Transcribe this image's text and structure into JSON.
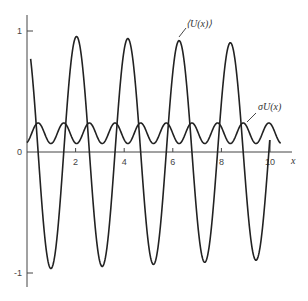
{
  "chart_data": {
    "type": "line",
    "title": "",
    "xlabel": "x",
    "ylabel": "",
    "xlim": [
      0,
      10.9
    ],
    "ylim": [
      -1.1,
      1.15
    ],
    "grid": false,
    "legend": "none",
    "x_ticks": [
      {
        "value": 2,
        "label": "2"
      },
      {
        "value": 4,
        "label": "4"
      },
      {
        "value": 6,
        "label": "6"
      },
      {
        "value": 8,
        "label": "8"
      },
      {
        "value": 10,
        "label": "10"
      }
    ],
    "y_ticks": [
      {
        "value": 1,
        "label": "1"
      },
      {
        "value": 0,
        "label": "0"
      },
      {
        "value": -1,
        "label": "-1"
      }
    ],
    "series": [
      {
        "name": "⟨U(x)⟩",
        "x_range": [
          0.15,
          10.0
        ],
        "model": "amplitude(x)*cos(2*pi*(x-phase)/period)",
        "period": 2.11,
        "phase": 2.04,
        "amplitude_start": 0.97,
        "amplitude_end": 0.89,
        "peaks": [
          [
            2.05,
            0.96
          ],
          [
            4.15,
            0.95
          ],
          [
            6.3,
            0.93
          ],
          [
            8.4,
            0.91
          ]
        ],
        "troughs": [
          [
            1.1,
            -0.97
          ],
          [
            3.15,
            -0.95
          ],
          [
            5.3,
            -0.93
          ],
          [
            7.35,
            -0.91
          ],
          [
            9.45,
            -0.88
          ]
        ]
      },
      {
        "name": "σU(x)",
        "x_range": [
          0.0,
          10.45
        ],
        "model": "mean - amp*cos(4*pi*(x-phase)/period)",
        "period": 2.11,
        "phase": 2.04,
        "mean": 0.155,
        "amp": 0.085,
        "peaks_value": 0.24,
        "troughs_value": 0.07
      }
    ],
    "annotations": [
      {
        "text": "⟨U(x)⟩",
        "points_to_x": 6.25,
        "points_to_series": "⟨U(x)⟩"
      },
      {
        "text": "σU(x)",
        "points_to_x": 9.0,
        "points_to_series": "σU(x)"
      }
    ]
  }
}
